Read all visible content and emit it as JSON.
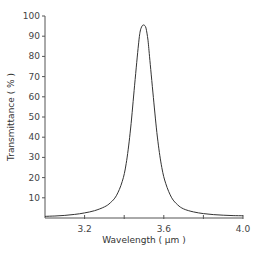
{
  "chart_data": {
    "type": "line",
    "title": "",
    "xlabel": "Wavelength ( µm )",
    "ylabel": "Transmittance ( % )",
    "xlim": [
      3.0,
      4.0
    ],
    "ylim": [
      0,
      100
    ],
    "grid": false,
    "legend": null,
    "x_ticks": [
      3.2,
      3.4,
      3.6,
      3.8,
      4.0
    ],
    "x_tick_labels": [
      "3.2",
      "",
      "3.6",
      "",
      "4.0"
    ],
    "y_ticks": [
      10,
      20,
      30,
      40,
      50,
      60,
      70,
      80,
      90,
      100
    ],
    "y_tick_labels": [
      "10",
      "20",
      "30",
      "40",
      "50",
      "60",
      "70",
      "80",
      "90",
      "100"
    ],
    "series": [
      {
        "name": "Transmittance",
        "x": [
          3.0,
          3.05,
          3.1,
          3.15,
          3.2,
          3.25,
          3.3,
          3.33,
          3.36,
          3.39,
          3.41,
          3.43,
          3.45,
          3.47,
          3.48,
          3.49,
          3.5,
          3.51,
          3.52,
          3.53,
          3.55,
          3.57,
          3.59,
          3.61,
          3.64,
          3.67,
          3.7,
          3.75,
          3.8,
          3.85,
          3.9,
          3.95,
          4.0
        ],
        "y": [
          0.8,
          1.0,
          1.3,
          1.8,
          2.5,
          3.6,
          5.5,
          7.5,
          11,
          18,
          27,
          42,
          63,
          84,
          92,
          95,
          95.5,
          94,
          88,
          78,
          57,
          38,
          25,
          17,
          10,
          6.5,
          4.5,
          3.0,
          2.2,
          1.7,
          1.4,
          1.2,
          1.1
        ]
      }
    ]
  },
  "plot": {
    "left": 45,
    "right": 243,
    "top": 16,
    "bottom": 218,
    "line_color": "#333333",
    "axis_color": "#555555"
  }
}
